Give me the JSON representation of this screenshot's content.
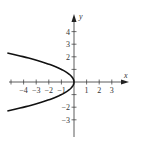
{
  "top_text": "",
  "chart_data": {
    "type": "line",
    "title": "",
    "xlabel": "x",
    "ylabel": "y",
    "xlim": [
      -5,
      4
    ],
    "ylim": [
      -4,
      5
    ],
    "x_ticks": [
      -4,
      -3,
      -2,
      -1,
      1,
      2,
      3
    ],
    "y_ticks": [
      -3,
      -2,
      -1,
      1,
      2,
      3,
      4
    ],
    "x_tick_labels": [
      "-4",
      "-3",
      "-2",
      "-1",
      "1",
      "2",
      "3"
    ],
    "y_tick_labels": [
      "-3",
      "-2",
      "4",
      "3",
      "2"
    ],
    "labeled_y_ticks": [
      4,
      3,
      2,
      -2,
      -3
    ],
    "labeled_x_ticks": [
      -4,
      -3,
      -2,
      -1,
      1,
      2,
      3
    ],
    "grid": false,
    "series": [
      {
        "name": "x = -y^2",
        "equation": "x = -y^2",
        "points": [
          {
            "x": -5.29,
            "y": 2.3
          },
          {
            "x": -4,
            "y": 2
          },
          {
            "x": -2.25,
            "y": 1.5
          },
          {
            "x": -1,
            "y": 1
          },
          {
            "x": -0.25,
            "y": 0.5
          },
          {
            "x": 0,
            "y": 0
          },
          {
            "x": -0.25,
            "y": -0.5
          },
          {
            "x": -1,
            "y": -1
          },
          {
            "x": -2.25,
            "y": -1.5
          },
          {
            "x": -4,
            "y": -2
          },
          {
            "x": -5.29,
            "y": -2.3
          }
        ],
        "color": "#111111"
      }
    ]
  }
}
